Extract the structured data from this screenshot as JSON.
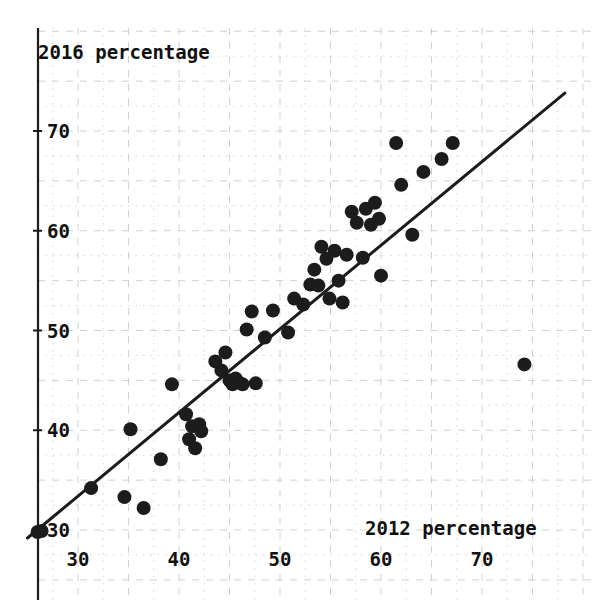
{
  "chart_data": {
    "type": "scatter",
    "title": "",
    "xlabel": "2012 percentage",
    "ylabel": "2016 percentage",
    "xlim": [
      24.5,
      79.0
    ],
    "ylim": [
      28.5,
      74.5
    ],
    "xticks": [
      30,
      40,
      50,
      60,
      70
    ],
    "xticklabels": [
      "30",
      "40",
      "50",
      "60",
      "70"
    ],
    "yticks": [
      30,
      40,
      50,
      60,
      70
    ],
    "yticklabels": [
      "30",
      "40",
      "50",
      "60",
      "70"
    ],
    "grid": true,
    "grid_major_step": 5,
    "grid_minor_step": 2.5,
    "grid_style": "dashed",
    "grid_color": "#c9c9c9",
    "marker": "filled-circle",
    "marker_color": "#1c1c1c",
    "marker_size": 9,
    "legend": "none",
    "fit_line": {
      "label": "diagonal reference line",
      "color": "#1c1c1c",
      "width": 3,
      "x_start": 25.0,
      "y_start": 29.2,
      "x_end": 78.2,
      "y_end": 73.8
    },
    "points": [
      {
        "x": 26.0,
        "y": 29.8
      },
      {
        "x": 26.4,
        "y": 29.9
      },
      {
        "x": 31.3,
        "y": 34.2
      },
      {
        "x": 34.6,
        "y": 33.3
      },
      {
        "x": 35.2,
        "y": 40.1
      },
      {
        "x": 36.5,
        "y": 32.2
      },
      {
        "x": 38.2,
        "y": 37.1
      },
      {
        "x": 39.3,
        "y": 44.6
      },
      {
        "x": 40.7,
        "y": 41.6
      },
      {
        "x": 41.0,
        "y": 39.1
      },
      {
        "x": 41.3,
        "y": 40.4
      },
      {
        "x": 41.6,
        "y": 38.2
      },
      {
        "x": 42.0,
        "y": 40.6
      },
      {
        "x": 42.2,
        "y": 39.9
      },
      {
        "x": 43.6,
        "y": 46.9
      },
      {
        "x": 44.2,
        "y": 46.0
      },
      {
        "x": 44.6,
        "y": 47.8
      },
      {
        "x": 45.0,
        "y": 45.0
      },
      {
        "x": 45.3,
        "y": 44.6
      },
      {
        "x": 45.6,
        "y": 45.2
      },
      {
        "x": 45.9,
        "y": 44.8
      },
      {
        "x": 46.3,
        "y": 44.6
      },
      {
        "x": 46.7,
        "y": 50.1
      },
      {
        "x": 47.2,
        "y": 51.9
      },
      {
        "x": 47.6,
        "y": 44.7
      },
      {
        "x": 48.5,
        "y": 49.3
      },
      {
        "x": 49.3,
        "y": 52.0
      },
      {
        "x": 50.8,
        "y": 49.8
      },
      {
        "x": 51.4,
        "y": 53.2
      },
      {
        "x": 52.3,
        "y": 52.6
      },
      {
        "x": 53.0,
        "y": 54.6
      },
      {
        "x": 53.4,
        "y": 56.1
      },
      {
        "x": 53.8,
        "y": 54.5
      },
      {
        "x": 54.1,
        "y": 58.4
      },
      {
        "x": 54.6,
        "y": 57.2
      },
      {
        "x": 54.9,
        "y": 53.2
      },
      {
        "x": 55.4,
        "y": 58.0
      },
      {
        "x": 55.8,
        "y": 55.0
      },
      {
        "x": 56.2,
        "y": 52.8
      },
      {
        "x": 56.6,
        "y": 57.6
      },
      {
        "x": 57.1,
        "y": 61.9
      },
      {
        "x": 57.6,
        "y": 60.8
      },
      {
        "x": 58.2,
        "y": 57.3
      },
      {
        "x": 58.5,
        "y": 62.2
      },
      {
        "x": 59.0,
        "y": 60.6
      },
      {
        "x": 59.4,
        "y": 62.8
      },
      {
        "x": 59.8,
        "y": 61.2
      },
      {
        "x": 60.0,
        "y": 55.5
      },
      {
        "x": 61.5,
        "y": 68.8
      },
      {
        "x": 62.0,
        "y": 64.6
      },
      {
        "x": 63.1,
        "y": 59.6
      },
      {
        "x": 64.2,
        "y": 65.9
      },
      {
        "x": 66.0,
        "y": 67.2
      },
      {
        "x": 67.1,
        "y": 68.8
      },
      {
        "x": 74.2,
        "y": 46.6
      }
    ]
  },
  "axes": {
    "y_axis_title": "2016 percentage",
    "x_axis_title": "2012 percentage",
    "y_tick_labels": [
      "70",
      "60",
      "50",
      "40",
      "30"
    ],
    "x_tick_labels": [
      "30",
      "40",
      "50",
      "60",
      "70"
    ]
  }
}
